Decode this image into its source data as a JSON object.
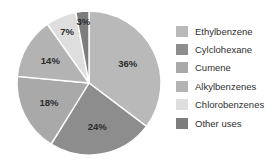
{
  "chart_data": {
    "type": "pie",
    "title": "",
    "categories": [
      "Ethylbenzene",
      "Cylclohexane",
      "Cumene",
      "Alkylbenzenes",
      "Chlorobenzenes",
      "Other uses"
    ],
    "values": [
      36,
      24,
      18,
      14,
      7,
      3
    ],
    "value_labels": [
      "36%",
      "24%",
      "18%",
      "14%",
      "7%",
      "3%"
    ],
    "unit": "%",
    "start_angle_deg": 0,
    "direction": "clockwise",
    "legend_position": "right",
    "grid": false,
    "colors": [
      "#b9b9b9",
      "#8d8d8d",
      "#a9a9a9",
      "#b3b3b3",
      "#dedede",
      "#7d7d7d"
    ],
    "slice_border_color": "#ffffff",
    "background_color": "#ffffff",
    "label_color": "#2b2b2b"
  },
  "legend": {
    "items": [
      {
        "label": "Ethylbenzene",
        "color": "#b9b9b9"
      },
      {
        "label": "Cylclohexane",
        "color": "#8d8d8d"
      },
      {
        "label": "Cumene",
        "color": "#a9a9a9"
      },
      {
        "label": "Alkylbenzenes",
        "color": "#b3b3b3"
      },
      {
        "label": "Chlorobenzenes",
        "color": "#dedede"
      },
      {
        "label": "Other uses",
        "color": "#7d7d7d"
      }
    ]
  }
}
